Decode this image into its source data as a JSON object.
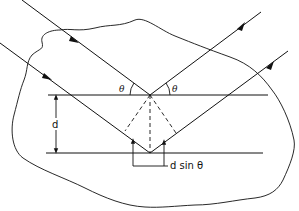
{
  "diagram": {
    "type": "Bragg diffraction geometry",
    "labels": {
      "theta_left": "θ",
      "theta_right": "θ",
      "spacing": "d",
      "path_difference": "d sin θ"
    },
    "elements": [
      "crystal boundary (irregular outline)",
      "upper lattice plane",
      "lower lattice plane",
      "incident ray 1",
      "reflected ray 1",
      "incident ray 2",
      "reflected ray 2",
      "dashed construction lines",
      "spacing arrow d",
      "path difference bracket"
    ],
    "colors": {
      "line": "#111111",
      "background": "#ffffff"
    }
  }
}
